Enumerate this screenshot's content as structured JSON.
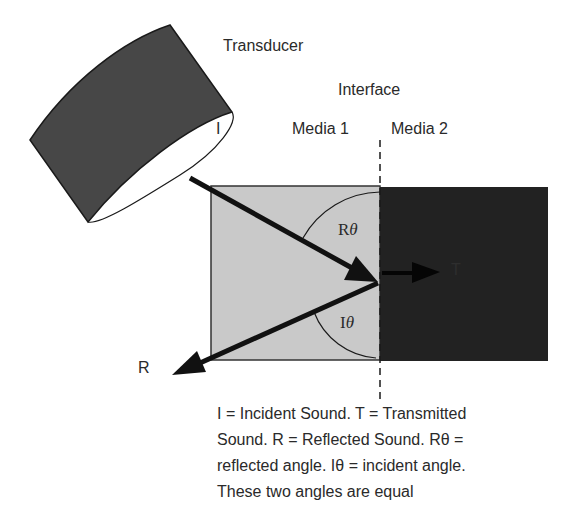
{
  "labels": {
    "transducer": "Transducer",
    "interface": "Interface",
    "media1": "Media 1",
    "media2": "Media 2",
    "incident": "I",
    "reflected": "R",
    "transmitted": "T",
    "reflected_angle_prefix": "R",
    "incident_angle_prefix": "I",
    "theta": "θ"
  },
  "caption": {
    "lines": [
      "I = Incident Sound. T = Transmitted",
      "Sound. R = Reflected Sound. Rθ =",
      "reflected angle. Iθ = incident angle.",
      "These two angles are equal"
    ]
  },
  "colors": {
    "media1_fill": "#c9c9c9",
    "media2_fill": "#222222",
    "transducer_fill": "#474747",
    "arrow": "#111111",
    "background": "#ffffff"
  }
}
